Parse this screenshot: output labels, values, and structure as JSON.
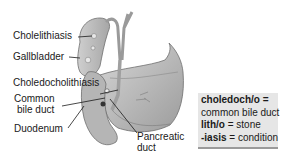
{
  "diagram": {
    "labels": {
      "cholelithiasis": "Cholelithiasis",
      "gallbladder": "Gallbladder",
      "choledocholithiasis": "Choledocholithiasis",
      "common_bile_duct_line1": "Common",
      "common_bile_duct_line2": "bile duct",
      "duodenum": "Duodenum",
      "pancreatic_duct_line1": "Pancreatic",
      "pancreatic_duct_line2": "duct"
    },
    "definitions": [
      {
        "term": "choledoch/o",
        "eq": " =",
        "meaning": "common bile duct"
      },
      {
        "term": "lith/o",
        "eq": " = ",
        "meaning": "stone"
      },
      {
        "term": "-iasis",
        "eq": " = ",
        "meaning": "condition"
      }
    ],
    "colors": {
      "organ_fill": "#b8b8b8",
      "organ_dark": "#8c8c8c",
      "definition_box": "#e6e6e6",
      "text": "#1a1a1a"
    }
  }
}
